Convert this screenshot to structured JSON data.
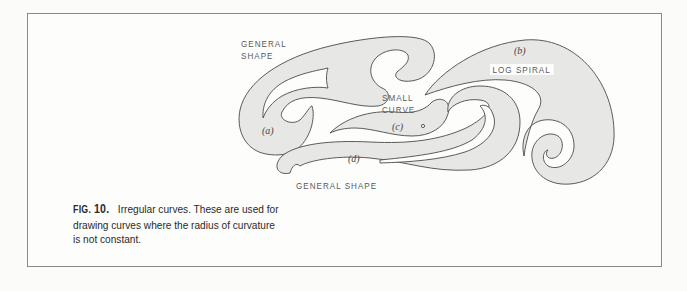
{
  "figure": {
    "number_prefix": "FIG.",
    "number": "10.",
    "caption_text": "Irregular curves. These are used for drawing curves where the radius of curvature is not constant.",
    "caption_lines": [
      "Irregular curves. These are used for",
      "drawing curves where the radius of curvature",
      "is not constant."
    ]
  },
  "labels": {
    "general_shape_top_line1": "GENERAL",
    "general_shape_top_line2": "SHAPE",
    "small_curve_line1": "SMALL",
    "small_curve_line2": "CURVE",
    "log_spiral": "LOG SPIRAL",
    "general_shape_bottom": "GENERAL SHAPE",
    "a": "(a)",
    "b": "(b)",
    "c": "(c)",
    "d": "(d)"
  },
  "colors": {
    "background": "#fbfbfa",
    "shape_fill": "#e7e7e5",
    "outline": "#4a4a4a",
    "frame_border": "#8a8a8a",
    "text": "#2a2a2a"
  }
}
